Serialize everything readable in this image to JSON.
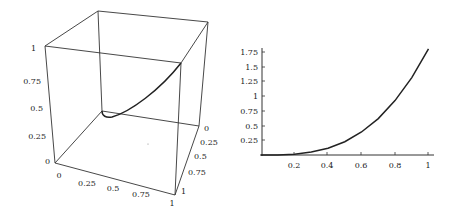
{
  "chart_data": [
    {
      "type": "line3d",
      "title": "",
      "description": "3D bounding box with a parametric space curve rising from the back-bottom corner region to the front-right top corner",
      "axes": {
        "x": {
          "ticks": [
            "0",
            "0.25",
            "0.5",
            "0.75",
            "1"
          ],
          "range": [
            0,
            1
          ]
        },
        "y": {
          "ticks": [
            "0",
            "0.25",
            "0.5",
            "0.75",
            "1"
          ],
          "range": [
            0,
            1
          ]
        },
        "z": {
          "ticks": [
            "0",
            "0.25",
            "0.5",
            "0.75",
            "1"
          ],
          "range": [
            0,
            1
          ]
        }
      },
      "series": [
        {
          "name": "space curve",
          "points_approx": [
            {
              "x": 0.0,
              "y": 0.0,
              "z": 0.5
            },
            {
              "x": 0.1,
              "y": 0.05,
              "z": 0.45
            },
            {
              "x": 0.5,
              "y": 0.5,
              "z": 0.65
            },
            {
              "x": 1.0,
              "y": 1.0,
              "z": 1.0
            }
          ]
        }
      ]
    },
    {
      "type": "line",
      "title": "",
      "xlabel": "",
      "ylabel": "",
      "x_ticks": [
        "0.2",
        "0.4",
        "0.6",
        "0.8",
        "1"
      ],
      "y_ticks": [
        "0.25",
        "0.5",
        "0.75",
        "1",
        "1.25",
        "1.5",
        "1.75"
      ],
      "xlim": [
        0,
        1
      ],
      "ylim": [
        0,
        1.8
      ],
      "grid": false,
      "series": [
        {
          "name": "curve",
          "x": [
            0,
            0.1,
            0.2,
            0.3,
            0.4,
            0.5,
            0.6,
            0.7,
            0.8,
            0.9,
            1.0
          ],
          "y": [
            0,
            0.002,
            0.014,
            0.049,
            0.115,
            0.225,
            0.389,
            0.617,
            0.922,
            1.312,
            1.8
          ]
        }
      ]
    }
  ],
  "plot3d": {
    "z_labels": [
      "0",
      "0.25",
      "0.5",
      "0.75",
      "1"
    ],
    "x_labels": [
      "0",
      "0.25",
      "0.5",
      "0.75",
      "1"
    ],
    "y_labels": [
      "0",
      "0.25",
      "0.5",
      "0.75",
      "1"
    ]
  },
  "plot2d": {
    "x_labels": [
      "0.2",
      "0.4",
      "0.6",
      "0.8",
      "1"
    ],
    "y_labels": [
      "0.25",
      "0.5",
      "0.75",
      "1",
      "1.25",
      "1.5",
      "1.75"
    ]
  }
}
